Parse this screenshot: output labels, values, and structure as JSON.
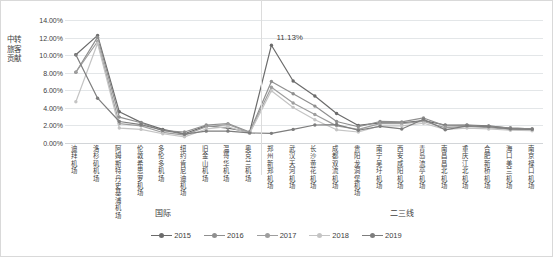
{
  "chart_data": {
    "type": "line",
    "title": "",
    "xlabel": "",
    "ylabel": "中转旅客贡献",
    "ylim": [
      0,
      14
    ],
    "ytick_labels": [
      "0.00%",
      "2.00%",
      "4.00%",
      "6.00%",
      "8.00%",
      "10.00%",
      "12.00%",
      "14.00%"
    ],
    "ytick_values": [
      0,
      2,
      4,
      6,
      8,
      10,
      12,
      14
    ],
    "grid": true,
    "legend_position": "bottom-center",
    "value_unit": "%",
    "categories": [
      "迪拜机场",
      "洛杉矶机场",
      "阿姆斯特丹史基浦机场",
      "伦敦希思罗机场",
      "多伦多机场",
      "纽约肯尼迪机场",
      "旧金山机场",
      "温哥华机场",
      "奥克兰机场",
      "郑州新郑机场",
      "武汉天河机场",
      "长沙黄花机场",
      "成都双流机场",
      "贵阳龙洞堡机场",
      "南宁吴圩机场",
      "西安咸阳机场",
      "青岛流亭机场",
      "南昌昌北机场",
      "重庆江北机场",
      "合肥新桥机场",
      "海口美兰机场",
      "南京禄口机场"
    ],
    "group_labels": [
      {
        "label": "国际",
        "start_index": 0,
        "end_index": 8
      },
      {
        "label": "二三线",
        "start_index": 9,
        "end_index": 21
      }
    ],
    "group_separator_after_index": 8,
    "annotations": [
      {
        "text": "11.13%",
        "series": "2015",
        "category": "郑州新郑机场",
        "value": 11.13
      }
    ],
    "series": [
      {
        "name": "2015",
        "color": "#6b6b6b",
        "values": [
          10.05,
          12.25,
          3.55,
          2.35,
          1.55,
          1.05,
          1.95,
          1.7,
          1.25,
          11.13,
          7.05,
          5.35,
          3.35,
          2.0,
          2.3,
          2.3,
          2.55,
          2.05,
          2.05,
          1.95,
          1.7,
          1.6
        ]
      },
      {
        "name": "2016",
        "color": "#8f8f8f",
        "values": [
          8.05,
          12.05,
          2.95,
          2.3,
          1.4,
          1.25,
          2.05,
          2.2,
          1.25,
          7.0,
          5.6,
          4.2,
          2.45,
          1.85,
          2.45,
          2.4,
          2.85,
          1.95,
          2.0,
          1.9,
          1.7,
          1.6
        ]
      },
      {
        "name": "2017",
        "color": "#9e9e9e",
        "values": [
          8.05,
          11.55,
          2.2,
          1.95,
          1.2,
          0.9,
          1.85,
          2.1,
          1.2,
          6.35,
          4.55,
          3.25,
          1.95,
          1.55,
          2.2,
          2.2,
          2.45,
          1.75,
          1.9,
          1.75,
          1.55,
          1.5
        ]
      },
      {
        "name": "2018",
        "color": "#c4c4c4",
        "values": [
          4.7,
          11.35,
          1.7,
          1.55,
          1.05,
          0.7,
          1.6,
          1.85,
          1.1,
          5.95,
          4.05,
          2.65,
          1.5,
          1.25,
          1.95,
          1.95,
          2.25,
          1.55,
          1.7,
          1.6,
          1.45,
          1.4
        ]
      },
      {
        "name": "2019",
        "color": "#7d7d7d",
        "values": [
          10.05,
          5.1,
          2.45,
          2.1,
          1.45,
          1.0,
          1.35,
          1.35,
          1.15,
          1.1,
          1.55,
          2.05,
          2.1,
          1.45,
          1.9,
          1.6,
          2.7,
          1.5,
          1.95,
          1.85,
          1.6,
          1.55
        ]
      }
    ]
  },
  "legend": {
    "entries": [
      "2015",
      "2016",
      "2017",
      "2018",
      "2019"
    ]
  }
}
